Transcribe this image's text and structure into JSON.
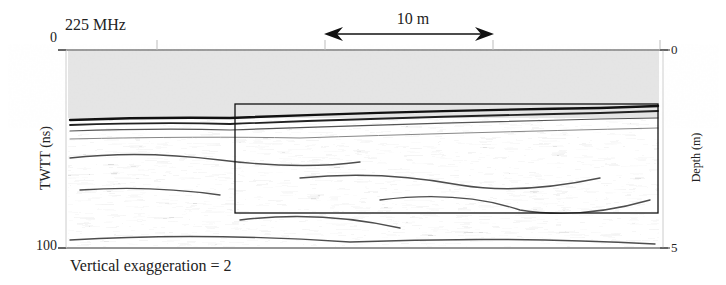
{
  "figure": {
    "frequency_label": "225 MHz",
    "scale_bar": {
      "label": "10 m",
      "length_m": 10
    },
    "left_axis": {
      "title": "TWTT (ns)",
      "ticks": [
        "0",
        "100"
      ]
    },
    "right_axis": {
      "title": "Depth (m)",
      "ticks": [
        "0",
        "5"
      ]
    },
    "vertical_exaggeration_label": "Vertical exaggeration = 2",
    "colors": {
      "air_zone": "#e4e4e4",
      "reflector_dark": "#1a1a1a",
      "background": "#ffffff",
      "box_outline": "#111111"
    },
    "highlight_box": {
      "description": "rectangle outlining region of interest in radargram"
    }
  }
}
